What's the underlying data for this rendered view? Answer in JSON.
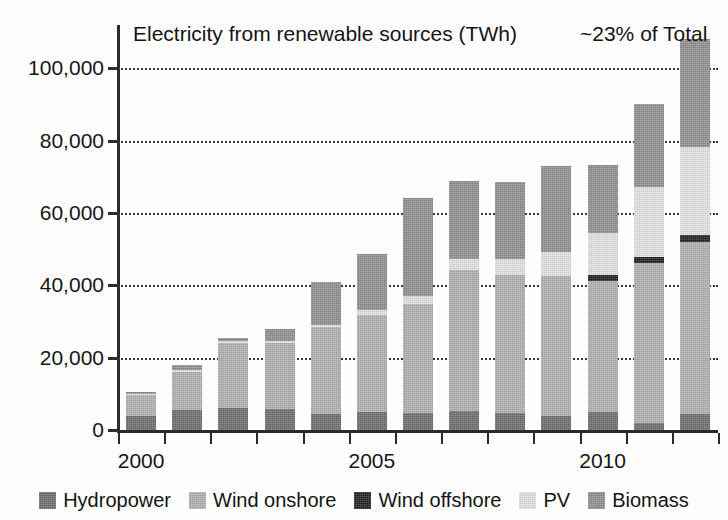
{
  "chart_data": {
    "type": "bar",
    "title": "Electricity from renewable sources (TWh)",
    "annotation": "~23% of Total",
    "xlabel": "",
    "ylabel": "",
    "stacked": true,
    "grid": true,
    "grid_style": "dotted-horizontal",
    "legend_position": "bottom",
    "ylim": [
      0,
      112000
    ],
    "ytick_labels": [
      "0",
      "20,000",
      "40,000",
      "60,000",
      "80,000",
      "100,000"
    ],
    "ytick_values": [
      0,
      20000,
      40000,
      60000,
      80000,
      100000
    ],
    "categories": [
      2000,
      2001,
      2002,
      2003,
      2004,
      2005,
      2006,
      2007,
      2008,
      2009,
      2010,
      2011,
      2012
    ],
    "xtick_labels_shown": [
      "2000",
      "2005",
      "2010"
    ],
    "xtick_label_indices": [
      0,
      5,
      10
    ],
    "series": [
      {
        "name": "Hydropower",
        "color": "#6d6d6d",
        "values": [
          4000,
          5500,
          6000,
          5800,
          4500,
          5000,
          4800,
          5300,
          4800,
          3900,
          5100,
          2000,
          4500
        ]
      },
      {
        "name": "Wind onshore",
        "color": "#b0b0b0",
        "values": [
          6200,
          10900,
          18500,
          18600,
          24000,
          26800,
          30000,
          39000,
          38000,
          38800,
          36200,
          44300,
          47500
        ]
      },
      {
        "name": "Wind offshore",
        "color": "#1f1f1f",
        "values": [
          0,
          0,
          0,
          0,
          0,
          0,
          0,
          0,
          0,
          0,
          1500,
          1600,
          1800
        ]
      },
      {
        "name": "PV",
        "color": "#e2e2e2",
        "values": [
          60,
          80,
          160,
          310,
          550,
          1280,
          2200,
          3100,
          4400,
          6600,
          11700,
          19300,
          24500
        ]
      },
      {
        "name": "Biomass",
        "color": "#8f8f8f",
        "values": [
          350,
          1400,
          800,
          3300,
          12000,
          15500,
          27100,
          21400,
          21400,
          23600,
          18900,
          23000,
          29900
        ]
      }
    ],
    "totals": [
      10610,
      17880,
      25460,
      28010,
      41050,
      48580,
      64100,
      68800,
      68600,
      72900,
      73400,
      90200,
      108200
    ]
  },
  "legend": {
    "items": [
      {
        "label": "Hydropower",
        "swatch": "#6d6d6d"
      },
      {
        "label": "Wind onshore",
        "swatch": "#b0b0b0"
      },
      {
        "label": "Wind offshore",
        "swatch": "#1f1f1f"
      },
      {
        "label": "PV",
        "swatch": "#e2e2e2"
      },
      {
        "label": "Biomass",
        "swatch": "#8f8f8f"
      }
    ]
  }
}
